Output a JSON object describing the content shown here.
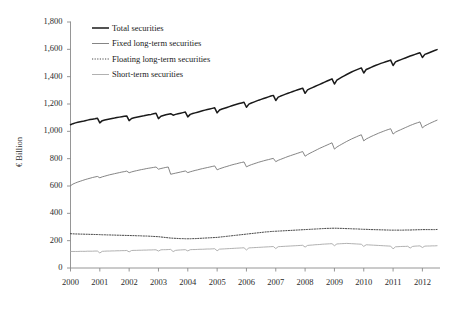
{
  "chart_data": {
    "type": "line",
    "title": "",
    "xlabel": "",
    "ylabel": "€ Billion",
    "ylim": [
      0,
      1800
    ],
    "ytick_labels": [
      "0",
      "200",
      "400",
      "600",
      "800",
      "1,000",
      "1,200",
      "1,400",
      "1,600",
      "1,800"
    ],
    "ytick_values": [
      0,
      200,
      400,
      600,
      800,
      1000,
      1200,
      1400,
      1600,
      1800
    ],
    "xtick_labels": [
      "2000",
      "2001",
      "2002",
      "2003",
      "2004",
      "2005",
      "2006",
      "2007",
      "2008",
      "2009",
      "2010",
      "2011",
      "2012"
    ],
    "xtick_values": [
      2000,
      2001,
      2002,
      2003,
      2004,
      2005,
      2006,
      2007,
      2008,
      2009,
      2010,
      2011,
      2012
    ],
    "xlim": [
      2000,
      2012.6
    ],
    "grid": false,
    "legend_position": "top-left-inside",
    "x": [
      2000.0,
      2000.083,
      2000.167,
      2000.25,
      2000.333,
      2000.417,
      2000.5,
      2000.583,
      2000.667,
      2000.75,
      2000.833,
      2000.917,
      2001.0,
      2001.083,
      2001.167,
      2001.25,
      2001.333,
      2001.417,
      2001.5,
      2001.583,
      2001.667,
      2001.75,
      2001.833,
      2001.917,
      2002.0,
      2002.083,
      2002.167,
      2002.25,
      2002.333,
      2002.417,
      2002.5,
      2002.583,
      2002.667,
      2002.75,
      2002.833,
      2002.917,
      2003.0,
      2003.083,
      2003.167,
      2003.25,
      2003.333,
      2003.417,
      2003.5,
      2003.583,
      2003.667,
      2003.75,
      2003.833,
      2003.917,
      2004.0,
      2004.083,
      2004.167,
      2004.25,
      2004.333,
      2004.417,
      2004.5,
      2004.583,
      2004.667,
      2004.75,
      2004.833,
      2004.917,
      2005.0,
      2005.083,
      2005.167,
      2005.25,
      2005.333,
      2005.417,
      2005.5,
      2005.583,
      2005.667,
      2005.75,
      2005.833,
      2005.917,
      2006.0,
      2006.083,
      2006.167,
      2006.25,
      2006.333,
      2006.417,
      2006.5,
      2006.583,
      2006.667,
      2006.75,
      2006.833,
      2006.917,
      2007.0,
      2007.083,
      2007.167,
      2007.25,
      2007.333,
      2007.417,
      2007.5,
      2007.583,
      2007.667,
      2007.75,
      2007.833,
      2007.917,
      2008.0,
      2008.083,
      2008.167,
      2008.25,
      2008.333,
      2008.417,
      2008.5,
      2008.583,
      2008.667,
      2008.75,
      2008.833,
      2008.917,
      2009.0,
      2009.083,
      2009.167,
      2009.25,
      2009.333,
      2009.417,
      2009.5,
      2009.583,
      2009.667,
      2009.75,
      2009.833,
      2009.917,
      2010.0,
      2010.083,
      2010.167,
      2010.25,
      2010.333,
      2010.417,
      2010.5,
      2010.583,
      2010.667,
      2010.75,
      2010.833,
      2010.917,
      2011.0,
      2011.083,
      2011.167,
      2011.25,
      2011.333,
      2011.417,
      2011.5,
      2011.583,
      2011.667,
      2011.75,
      2011.833,
      2011.917,
      2012.0,
      2012.083,
      2012.167,
      2012.25,
      2012.333,
      2012.417,
      2012.5
    ],
    "series": [
      {
        "name": "Total securities",
        "color": "#1a1a1a",
        "width": 1.5,
        "dash": "none",
        "values": [
          1048,
          1056,
          1062,
          1066,
          1070,
          1073,
          1078,
          1082,
          1086,
          1089,
          1092,
          1096,
          1062,
          1078,
          1083,
          1087,
          1091,
          1094,
          1097,
          1101,
          1104,
          1107,
          1110,
          1113,
          1078,
          1094,
          1099,
          1103,
          1107,
          1111,
          1114,
          1118,
          1121,
          1124,
          1128,
          1132,
          1093,
          1110,
          1116,
          1121,
          1125,
          1129,
          1118,
          1124,
          1129,
          1133,
          1137,
          1141,
          1106,
          1124,
          1130,
          1135,
          1140,
          1145,
          1150,
          1155,
          1160,
          1164,
          1168,
          1172,
          1135,
          1156,
          1163,
          1169,
          1175,
          1181,
          1187,
          1193,
          1198,
          1203,
          1208,
          1213,
          1176,
          1199,
          1207,
          1214,
          1221,
          1228,
          1234,
          1240,
          1246,
          1252,
          1258,
          1263,
          1226,
          1250,
          1258,
          1265,
          1272,
          1279,
          1285,
          1292,
          1298,
          1304,
          1310,
          1316,
          1278,
          1303,
          1312,
          1320,
          1328,
          1336,
          1344,
          1352,
          1360,
          1368,
          1376,
          1384,
          1346,
          1375,
          1386,
          1396,
          1406,
          1416,
          1425,
          1434,
          1442,
          1450,
          1457,
          1464,
          1427,
          1452,
          1460,
          1468,
          1476,
          1483,
          1490,
          1497,
          1503,
          1509,
          1515,
          1521,
          1482,
          1508,
          1516,
          1523,
          1530,
          1537,
          1544,
          1551,
          1557,
          1563,
          1569,
          1575,
          1540,
          1563,
          1570,
          1577,
          1584,
          1591,
          1598
        ]
      },
      {
        "name": "Fixed long-term securities",
        "color": "#777777",
        "width": 0.9,
        "dash": "none",
        "values": [
          602,
          614,
          622,
          629,
          635,
          641,
          647,
          652,
          657,
          662,
          666,
          670,
          660,
          667,
          672,
          677,
          682,
          686,
          690,
          694,
          698,
          702,
          705,
          709,
          697,
          703,
          708,
          712,
          716,
          720,
          723,
          727,
          730,
          733,
          736,
          739,
          723,
          728,
          732,
          736,
          739,
          686,
          690,
          694,
          698,
          702,
          706,
          710,
          698,
          704,
          709,
          714,
          718,
          723,
          727,
          731,
          735,
          739,
          743,
          747,
          718,
          726,
          732,
          738,
          743,
          749,
          754,
          759,
          763,
          768,
          772,
          776,
          740,
          749,
          756,
          762,
          768,
          774,
          779,
          784,
          789,
          793,
          798,
          802,
          778,
          788,
          795,
          802,
          809,
          816,
          822,
          828,
          834,
          840,
          846,
          852,
          818,
          830,
          840,
          849,
          858,
          867,
          876,
          884,
          892,
          900,
          908,
          916,
          870,
          885,
          896,
          906,
          916,
          926,
          935,
          944,
          952,
          960,
          968,
          975,
          930,
          944,
          953,
          962,
          970,
          978,
          986,
          993,
          1000,
          1007,
          1013,
          1019,
          980,
          994,
          1003,
          1011,
          1019,
          1027,
          1035,
          1043,
          1050,
          1057,
          1063,
          1069,
          1025,
          1040,
          1049,
          1058,
          1066,
          1074,
          1082
        ]
      },
      {
        "name": "Floating long-term securities",
        "color": "#333333",
        "width": 0.9,
        "dash": "1.2,1.4",
        "values": [
          251,
          250,
          249,
          249,
          248,
          248,
          247,
          247,
          246,
          246,
          245,
          245,
          244,
          243,
          243,
          242,
          242,
          241,
          241,
          240,
          240,
          239,
          239,
          238,
          238,
          237,
          237,
          236,
          236,
          235,
          234,
          234,
          233,
          232,
          231,
          230,
          229,
          227,
          225,
          223,
          221,
          219,
          218,
          217,
          216,
          215,
          215,
          214,
          214,
          214,
          215,
          215,
          216,
          217,
          218,
          219,
          220,
          221,
          222,
          223,
          224,
          226,
          228,
          230,
          232,
          234,
          236,
          238,
          240,
          242,
          244,
          246,
          248,
          250,
          252,
          254,
          256,
          258,
          260,
          262,
          264,
          265,
          267,
          268,
          269,
          270,
          271,
          272,
          273,
          274,
          275,
          276,
          277,
          278,
          279,
          280,
          281,
          282,
          283,
          284,
          285,
          286,
          287,
          288,
          289,
          290,
          290,
          291,
          291,
          291,
          290,
          290,
          289,
          288,
          288,
          287,
          286,
          286,
          285,
          284,
          283,
          283,
          282,
          281,
          281,
          280,
          280,
          279,
          279,
          278,
          278,
          277,
          277,
          277,
          277,
          277,
          277,
          278,
          278,
          278,
          279,
          279,
          280,
          280,
          281,
          281,
          281,
          281,
          281,
          281,
          282
        ]
      },
      {
        "name": "Short-term securities",
        "color": "#a8a8a8",
        "width": 0.9,
        "dash": "none",
        "values": [
          121,
          121,
          121,
          121,
          122,
          122,
          122,
          123,
          123,
          123,
          124,
          124,
          110,
          122,
          123,
          124,
          124,
          125,
          125,
          126,
          126,
          127,
          127,
          128,
          118,
          128,
          129,
          129,
          130,
          130,
          131,
          131,
          132,
          132,
          133,
          133,
          124,
          133,
          134,
          134,
          135,
          136,
          120,
          129,
          131,
          132,
          133,
          134,
          125,
          134,
          135,
          135,
          136,
          137,
          137,
          138,
          139,
          139,
          140,
          141,
          126,
          138,
          139,
          140,
          141,
          142,
          143,
          144,
          145,
          146,
          147,
          148,
          132,
          147,
          148,
          149,
          150,
          151,
          152,
          153,
          154,
          155,
          156,
          157,
          142,
          156,
          157,
          158,
          159,
          160,
          161,
          162,
          163,
          164,
          165,
          166,
          153,
          165,
          167,
          168,
          170,
          171,
          172,
          174,
          175,
          176,
          177,
          178,
          163,
          176,
          177,
          178,
          179,
          180,
          179,
          178,
          177,
          176,
          175,
          174,
          158,
          170,
          169,
          168,
          167,
          166,
          165,
          164,
          163,
          162,
          161,
          160,
          140,
          155,
          156,
          157,
          158,
          158,
          159,
          146,
          158,
          160,
          161,
          162,
          150,
          160,
          161,
          161,
          162,
          162,
          163
        ]
      }
    ]
  },
  "legend": {
    "items": [
      {
        "label": "Total securities"
      },
      {
        "label": "Fixed long-term securities"
      },
      {
        "label": "Floating long-term securities"
      },
      {
        "label": "Short-term securities"
      }
    ]
  }
}
